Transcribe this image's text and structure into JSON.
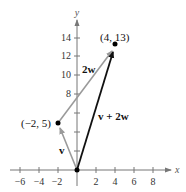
{
  "diagram": {
    "axes": {
      "x_label": "x",
      "y_label": "y",
      "x_ticks": [
        {
          "value": -6,
          "label": "−6"
        },
        {
          "value": -4,
          "label": "−4"
        },
        {
          "value": -2,
          "label": "−2"
        },
        {
          "value": 2,
          "label": "2"
        },
        {
          "value": 4,
          "label": "4"
        },
        {
          "value": 6,
          "label": "6"
        },
        {
          "value": 8,
          "label": "8"
        }
      ],
      "y_ticks": [
        {
          "value": 8,
          "label": "8"
        },
        {
          "value": 10,
          "label": "10"
        },
        {
          "value": 12,
          "label": "12"
        },
        {
          "value": 14,
          "label": "14"
        }
      ]
    },
    "points": [
      {
        "name": "tip-v",
        "x": -2,
        "y": 5,
        "label": "(−2, 5)"
      },
      {
        "name": "tip-sum",
        "x": 4,
        "y": 13,
        "label": "(4, 13)"
      },
      {
        "name": "origin",
        "x": 0,
        "y": 0,
        "label": ""
      }
    ],
    "vectors": [
      {
        "name": "v",
        "label": "v",
        "from": [
          0,
          0
        ],
        "to": [
          -2,
          5
        ],
        "color": "#9a9a9a"
      },
      {
        "name": "2w",
        "label": "2w",
        "from": [
          -2,
          5
        ],
        "to": [
          4,
          13
        ],
        "color": "#9a9a9a"
      },
      {
        "name": "v+2w",
        "label": "v + 2w",
        "from": [
          0,
          0
        ],
        "to": [
          4,
          13
        ],
        "color": "#111111"
      }
    ],
    "colors": {
      "axis": "#777777",
      "light_vector": "#9a9a9a",
      "dark_vector": "#111111",
      "point": "#000000"
    }
  }
}
